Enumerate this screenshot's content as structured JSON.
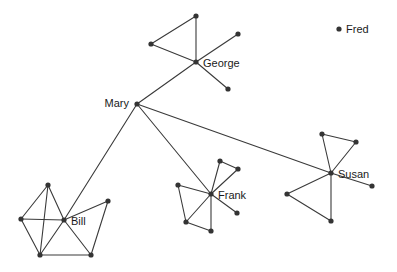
{
  "figure": {
    "type": "network-graph",
    "width": 397,
    "height": 272,
    "background_color": "#ffffff",
    "node_color": "#343434",
    "edge_color": "#3a3a3a",
    "label_color": "#1a1a1a",
    "node_radius": 2.6,
    "edge_width": 1.1
  },
  "labels": {
    "mary": "Mary",
    "george": "George",
    "bill": "Bill",
    "frank": "Frank",
    "susan": "Susan",
    "fred": "Fred"
  },
  "nodes": [
    {
      "id": "mary",
      "label": "Mary",
      "x": 137,
      "y": 104,
      "labeled": true,
      "label_dx": -8,
      "label_dy": 0,
      "label_anchor": "end"
    },
    {
      "id": "george",
      "label": "George",
      "x": 196,
      "y": 62,
      "labeled": true,
      "label_dx": 7,
      "label_dy": 2,
      "label_anchor": "start"
    },
    {
      "id": "bill",
      "label": "Bill",
      "x": 64,
      "y": 220,
      "labeled": true,
      "label_dx": 7,
      "label_dy": 2,
      "label_anchor": "start"
    },
    {
      "id": "frank",
      "label": "Frank",
      "x": 211,
      "y": 194,
      "labeled": true,
      "label_dx": 7,
      "label_dy": 2,
      "label_anchor": "start"
    },
    {
      "id": "susan",
      "label": "Susan",
      "x": 331,
      "y": 173,
      "labeled": true,
      "label_dx": 7,
      "label_dy": 2,
      "label_anchor": "start"
    },
    {
      "id": "fred",
      "label": "Fred",
      "x": 339,
      "y": 29,
      "labeled": true,
      "label_dx": 7,
      "label_dy": 1,
      "label_anchor": "start"
    },
    {
      "id": "g1",
      "label": "",
      "x": 196,
      "y": 16,
      "labeled": false
    },
    {
      "id": "g2",
      "label": "",
      "x": 151,
      "y": 44,
      "labeled": false
    },
    {
      "id": "g3",
      "label": "",
      "x": 238,
      "y": 34,
      "labeled": false
    },
    {
      "id": "g4",
      "label": "",
      "x": 228,
      "y": 89,
      "labeled": false
    },
    {
      "id": "b1",
      "label": "",
      "x": 48,
      "y": 185,
      "labeled": false
    },
    {
      "id": "b2",
      "label": "",
      "x": 21,
      "y": 219,
      "labeled": false
    },
    {
      "id": "b3",
      "label": "",
      "x": 40,
      "y": 255,
      "labeled": false
    },
    {
      "id": "b4",
      "label": "",
      "x": 91,
      "y": 255,
      "labeled": false
    },
    {
      "id": "b5",
      "label": "",
      "x": 108,
      "y": 201,
      "labeled": false
    },
    {
      "id": "f1",
      "label": "",
      "x": 220,
      "y": 161,
      "labeled": false
    },
    {
      "id": "f2",
      "label": "",
      "x": 238,
      "y": 169,
      "labeled": false
    },
    {
      "id": "f3",
      "label": "",
      "x": 178,
      "y": 185,
      "labeled": false
    },
    {
      "id": "f4",
      "label": "",
      "x": 186,
      "y": 222,
      "labeled": false
    },
    {
      "id": "f5",
      "label": "",
      "x": 211,
      "y": 231,
      "labeled": false
    },
    {
      "id": "f6",
      "label": "",
      "x": 237,
      "y": 213,
      "labeled": false
    },
    {
      "id": "s1",
      "label": "",
      "x": 322,
      "y": 134,
      "labeled": false
    },
    {
      "id": "s2",
      "label": "",
      "x": 356,
      "y": 142,
      "labeled": false
    },
    {
      "id": "s3",
      "label": "",
      "x": 372,
      "y": 186,
      "labeled": false
    },
    {
      "id": "s4",
      "label": "",
      "x": 287,
      "y": 194,
      "labeled": false
    },
    {
      "id": "s5",
      "label": "",
      "x": 331,
      "y": 221,
      "labeled": false
    }
  ],
  "edges": [
    {
      "source": "mary",
      "target": "george"
    },
    {
      "source": "mary",
      "target": "bill"
    },
    {
      "source": "mary",
      "target": "frank"
    },
    {
      "source": "mary",
      "target": "susan"
    },
    {
      "source": "george",
      "target": "g1"
    },
    {
      "source": "george",
      "target": "g2"
    },
    {
      "source": "george",
      "target": "g3"
    },
    {
      "source": "george",
      "target": "g4"
    },
    {
      "source": "g1",
      "target": "g2"
    },
    {
      "source": "bill",
      "target": "b1"
    },
    {
      "source": "bill",
      "target": "b2"
    },
    {
      "source": "bill",
      "target": "b3"
    },
    {
      "source": "bill",
      "target": "b4"
    },
    {
      "source": "bill",
      "target": "b5"
    },
    {
      "source": "b1",
      "target": "b2"
    },
    {
      "source": "b1",
      "target": "b3"
    },
    {
      "source": "b2",
      "target": "b3"
    },
    {
      "source": "b3",
      "target": "b4"
    },
    {
      "source": "b4",
      "target": "b5"
    },
    {
      "source": "frank",
      "target": "f1"
    },
    {
      "source": "frank",
      "target": "f2"
    },
    {
      "source": "frank",
      "target": "f3"
    },
    {
      "source": "frank",
      "target": "f4"
    },
    {
      "source": "frank",
      "target": "f5"
    },
    {
      "source": "frank",
      "target": "f6"
    },
    {
      "source": "f1",
      "target": "f2"
    },
    {
      "source": "f3",
      "target": "f4"
    },
    {
      "source": "f4",
      "target": "f5"
    },
    {
      "source": "susan",
      "target": "s1"
    },
    {
      "source": "susan",
      "target": "s2"
    },
    {
      "source": "susan",
      "target": "s3"
    },
    {
      "source": "susan",
      "target": "s4"
    },
    {
      "source": "susan",
      "target": "s5"
    },
    {
      "source": "s1",
      "target": "s2"
    },
    {
      "source": "s4",
      "target": "s5"
    }
  ],
  "legend": {
    "isolated_node": {
      "label": "Fred",
      "x": 339,
      "y": 29
    }
  }
}
